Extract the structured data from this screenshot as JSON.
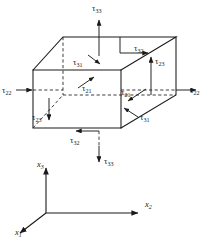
{
  "figure": {
    "kind": "stress-component-cube-diagram",
    "background": "#ffffff",
    "line_color": "#1a1a1a"
  },
  "tau": "τ",
  "stress_labels": [
    {
      "name": "tau-33-top",
      "greek": "τ",
      "sub": "33",
      "x": 92,
      "y": 4,
      "arrow": "up"
    },
    {
      "name": "tau-32-top-face",
      "greek": "τ",
      "sub": "32",
      "x": 134,
      "y": 44,
      "arrow": "right"
    },
    {
      "name": "tau-23-top-right",
      "greek": "τ",
      "sub": "23",
      "x": 155,
      "y": 57,
      "arrow": "up"
    },
    {
      "name": "tau-31-top-face",
      "greek": "τ",
      "sub": "31",
      "x": 73,
      "y": 58,
      "arrow": "down-right"
    },
    {
      "name": "tau-22-left",
      "greek": "τ",
      "sub": "22",
      "x": 2,
      "y": 86,
      "arrow": "right"
    },
    {
      "name": "tau-22-right",
      "greek": "τ",
      "sub": "22",
      "x": 190,
      "y": 86,
      "arrow": "right"
    },
    {
      "name": "tau-21-left-face",
      "greek": "τ",
      "sub": "21",
      "x": 82,
      "y": 84,
      "arrow": "up-right"
    },
    {
      "name": "tau-21-right-face",
      "greek": "τ",
      "sub": "21",
      "x": 121,
      "y": 88,
      "arrow": "down-left"
    },
    {
      "name": "tau-23-front-face",
      "greek": "τ",
      "sub": "23",
      "x": 32,
      "y": 113,
      "arrow": "down"
    },
    {
      "name": "tau-31-bottom-right",
      "greek": "τ",
      "sub": "31",
      "x": 140,
      "y": 113,
      "arrow": "up-left"
    },
    {
      "name": "tau-32-bottom-face",
      "greek": "τ",
      "sub": "32",
      "x": 70,
      "y": 136,
      "arrow": "left"
    },
    {
      "name": "tau-33-bottom",
      "greek": "τ",
      "sub": "33",
      "x": 104,
      "y": 157,
      "arrow": "down"
    }
  ],
  "axes": [
    {
      "name": "axis-x3",
      "letter": "x",
      "sub": "3",
      "x": 37,
      "y": 160,
      "direction": "up"
    },
    {
      "name": "axis-x2",
      "letter": "x",
      "sub": "2",
      "x": 145,
      "y": 200,
      "direction": "right"
    },
    {
      "name": "axis-x1",
      "letter": "x",
      "sub": "1",
      "x": 15,
      "y": 228,
      "direction": "down-left"
    }
  ]
}
